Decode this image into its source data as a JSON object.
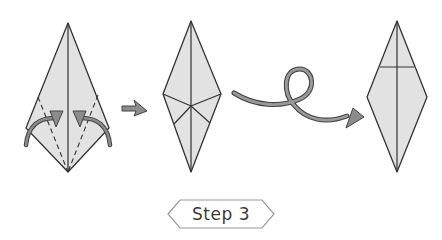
{
  "diagram": {
    "step_label": "Step 3",
    "colors": {
      "paper_fill": "#e2e2e2",
      "line": "#333333",
      "arrow_fill": "#8c8c8c",
      "arrow_stroke": "#444444",
      "badge_stroke": "#9a9a9a"
    },
    "figures": [
      {
        "id": "kite-with-fold-lines",
        "description": "Kite shape with dashed valley folds and curved arrows folding lower edges to center"
      },
      {
        "id": "folded-diamond",
        "description": "Diamond with crease lines meeting at center"
      },
      {
        "id": "turned-over-diamond",
        "description": "Diamond turned over with horizontal crease"
      }
    ],
    "arrows": [
      {
        "id": "next-arrow",
        "meaning": "proceed to next step"
      },
      {
        "id": "turn-over-arrow",
        "meaning": "turn the model over"
      }
    ]
  }
}
